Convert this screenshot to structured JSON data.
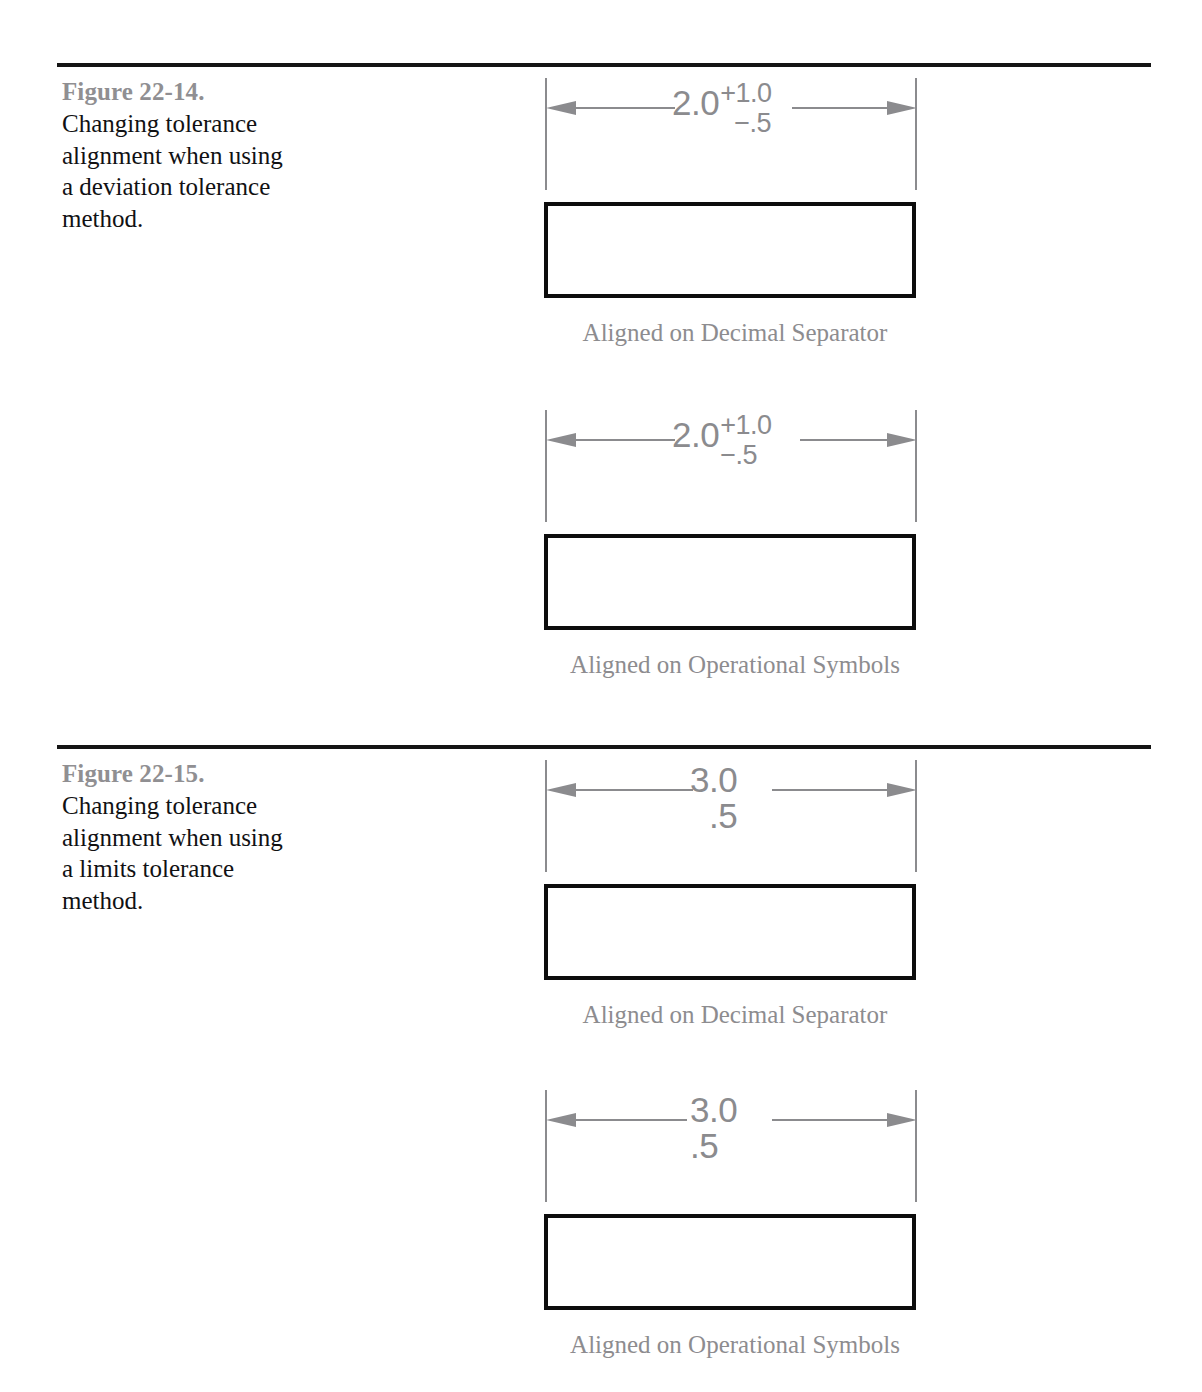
{
  "page": {
    "rules": [
      "top-rule",
      "middle-rule"
    ],
    "colors": {
      "figure_label": "#908f92",
      "figure_description": "#111113",
      "drawing_line": "#8b8b8e",
      "part_outline": "#0d0d0d",
      "caption": "#8d8c8f",
      "background": "#ffffff"
    }
  },
  "figures": [
    {
      "label": "Figure 22-14.",
      "description": "Changing tolerance alignment when using a deviation tolerance method.",
      "drawings": [
        {
          "tolerance_type": "deviation",
          "nominal": "2.0",
          "upper": "+1.0",
          "lower": "−.5",
          "alignment": "decimal",
          "caption": "Aligned on Decimal Separator"
        },
        {
          "tolerance_type": "deviation",
          "nominal": "2.0",
          "upper": "+1.0",
          "lower": "−.5",
          "alignment": "symbol",
          "caption": "Aligned on Operational Symbols"
        }
      ]
    },
    {
      "label": "Figure 22-15.",
      "description": "Changing tolerance alignment when using a limits tolerance method.",
      "drawings": [
        {
          "tolerance_type": "limits",
          "upper_limit": "3.0",
          "lower_limit": ".5",
          "alignment": "decimal",
          "caption": "Aligned on Decimal Separator"
        },
        {
          "tolerance_type": "limits",
          "upper_limit": "3.0",
          "lower_limit": ".5",
          "alignment": "symbol",
          "caption": "Aligned on Operational Symbols"
        }
      ]
    }
  ]
}
